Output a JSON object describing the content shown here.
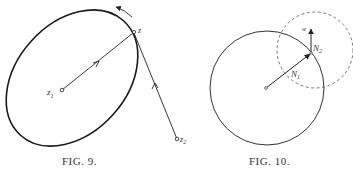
{
  "figures": [
    {
      "id": "fig9",
      "caption": "FIG. 9.",
      "labels": {
        "z": "z",
        "z1_base": "z",
        "z1_sub": "1",
        "z2_base": "z",
        "z2_sub": "2"
      },
      "elements": [
        "ellipse contour",
        "vector z1→z with arrow",
        "vector z2→z with arrow",
        "orientation arrow (counterclockwise) on contour near z"
      ]
    },
    {
      "id": "fig10",
      "caption": "FIG. 10.",
      "labels": {
        "w": "w",
        "N1_base": "N",
        "N1_sub": "1",
        "N2_base": "N",
        "N2_sub": "2"
      },
      "elements": [
        "solid circle N1",
        "dashed circle N2 centered on boundary point",
        "radial vector from center to boundary point",
        "vector w pointing up from boundary point"
      ]
    }
  ]
}
